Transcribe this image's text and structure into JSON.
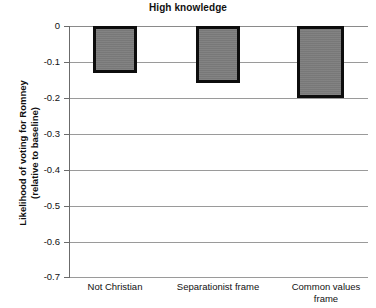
{
  "chart_data": {
    "type": "bar",
    "title": "High knowledge",
    "xlabel": "",
    "ylabel_line1": "Likelihood of voting for Romney",
    "ylabel_line2": "(relative to baseline)",
    "categories": [
      "Not Christian",
      "Separationist frame",
      "Common values frame"
    ],
    "values": [
      -0.13,
      -0.16,
      -0.2
    ],
    "ylim": [
      -0.7,
      0
    ],
    "ytick_labels": [
      "0",
      "-0.1",
      "-0.2",
      "-0.3",
      "-0.4",
      "-0.5",
      "-0.6",
      "-0.7"
    ],
    "ytick_values": [
      0,
      -0.1,
      -0.2,
      -0.3,
      -0.4,
      -0.5,
      -0.6,
      -0.7
    ],
    "grid": true,
    "legend": "none",
    "bar_fill_color": "#7d7d7d",
    "bar_border_color": "#0d0d0d",
    "gridline_color": "#9a9a9a",
    "axis_color": "#6b6b6b",
    "background_color": "#ffffff"
  },
  "category_labels": {
    "cat0_line1": "Not Christian",
    "cat0_line2": "",
    "cat1_line1": "Separationist frame",
    "cat1_line2": "",
    "cat2_line1": "Common values",
    "cat2_line2": "frame"
  },
  "ticks": {
    "t0": "0",
    "t1": "-0.1",
    "t2": "-0.2",
    "t3": "-0.3",
    "t4": "-0.4",
    "t5": "-0.5",
    "t6": "-0.6",
    "t7": "-0.7"
  }
}
